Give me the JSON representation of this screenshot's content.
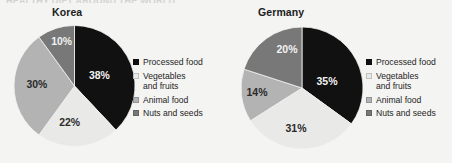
{
  "cut_off_title": "HEALTHY DIET AROUND THE WORLD",
  "colors": {
    "background": "#f4f4f2",
    "processed_food": "#111111",
    "vegetables_and_fruits": "#e9e9e7",
    "animal_food": "#b3b3b3",
    "nuts_and_seeds": "#787878"
  },
  "legend": {
    "items": [
      {
        "label": "Processed food",
        "label_line2": "",
        "color": "#111111",
        "swatch_name": "swatch-processed-food"
      },
      {
        "label": "Vegetables",
        "label_line2": "and fruits",
        "color": "#e9e9e7",
        "swatch_name": "swatch-vegetables-and-fruits"
      },
      {
        "label": "Animal food",
        "label_line2": "",
        "color": "#b3b3b3",
        "swatch_name": "swatch-animal-food"
      },
      {
        "label": "Nuts and seeds",
        "label_line2": "",
        "color": "#787878",
        "swatch_name": "swatch-nuts-and-seeds"
      }
    ]
  },
  "charts": {
    "korea": {
      "title": "Korea",
      "labels": [
        "38%",
        "22%",
        "30%",
        "10%"
      ]
    },
    "germany": {
      "title": "Germany",
      "labels": [
        "35%",
        "31%",
        "14%",
        "20%"
      ]
    }
  },
  "chart_data": [
    {
      "type": "pie",
      "title": "Korea",
      "categories": [
        "Processed food",
        "Vegetables and fruits",
        "Animal food",
        "Nuts and seeds"
      ],
      "values": [
        38,
        22,
        30,
        10
      ],
      "value_labels": [
        "38%",
        "22%",
        "30%",
        "10%"
      ],
      "units": "percent",
      "total": 100,
      "start_angle_deg": 0,
      "direction": "clockwise",
      "colors": [
        "#111111",
        "#e9e9e7",
        "#b3b3b3",
        "#787878"
      ],
      "legend_position": "right",
      "grid": false
    },
    {
      "type": "pie",
      "title": "Germany",
      "categories": [
        "Processed food",
        "Vegetables and fruits",
        "Animal food",
        "Nuts and seeds"
      ],
      "values": [
        35,
        31,
        14,
        20
      ],
      "value_labels": [
        "35%",
        "31%",
        "14%",
        "20%"
      ],
      "units": "percent",
      "total": 100,
      "start_angle_deg": 0,
      "direction": "clockwise",
      "colors": [
        "#111111",
        "#e9e9e7",
        "#b3b3b3",
        "#787878"
      ],
      "legend_position": "right",
      "grid": false
    }
  ]
}
